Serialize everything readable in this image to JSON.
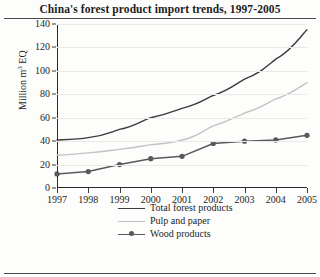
{
  "chart_data": {
    "type": "line",
    "title": "China's forest product import trends, 1997-2005",
    "xlabel": "",
    "ylabel": "Million m³ EQ",
    "ylabel_main": "Million m",
    "ylabel_sup": "3",
    "ylabel_tail": " EQ",
    "x": [
      1997,
      1998,
      1999,
      2000,
      2001,
      2002,
      2003,
      2004,
      2005
    ],
    "categories": [
      "1997",
      "1998",
      "1999",
      "2000",
      "2001",
      "2002",
      "2003",
      "2004",
      "2005"
    ],
    "yticks": [
      0,
      20,
      40,
      60,
      80,
      100,
      120,
      140
    ],
    "ylim": [
      0,
      140
    ],
    "xlim": [
      1997,
      2005
    ],
    "grid": "horizontal",
    "legend_position": "bottom",
    "series": [
      {
        "name": "Total forest products",
        "color": "#3b3b3b",
        "marker": "none",
        "values": [
          41,
          43,
          50,
          60,
          68,
          79,
          93,
          110,
          135
        ]
      },
      {
        "name": "Pulp and paper",
        "color": "#c3c3c3",
        "marker": "none",
        "values": [
          28,
          30,
          33,
          37,
          41,
          53,
          64,
          76,
          90
        ]
      },
      {
        "name": "Wood products",
        "color": "#595959",
        "marker": "circle",
        "values": [
          12,
          14,
          20,
          25,
          27,
          38,
          40,
          41,
          45
        ]
      }
    ]
  }
}
